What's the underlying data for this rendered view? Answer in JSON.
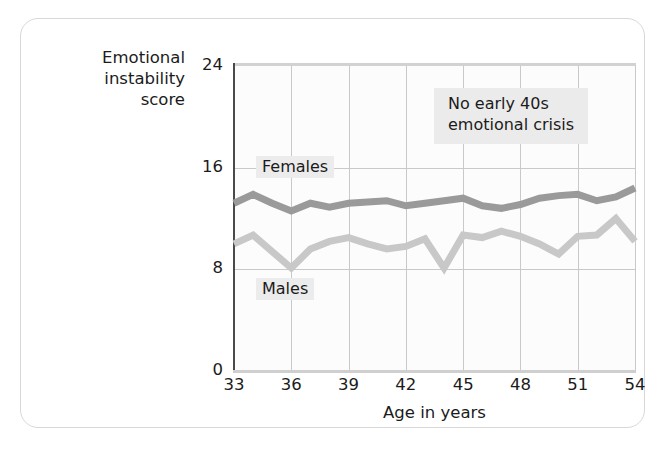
{
  "figure": {
    "y_axis_title": "Emotional\ninstability\nscore",
    "x_axis_title": "Age in years",
    "annotation": "No early 40s\nemotional crisis",
    "label_females": "Females",
    "label_males": "Males",
    "color_females": "#9a9a9a",
    "color_males": "#c8c8c8",
    "color_grid": "#c9c9c9",
    "color_axis": "#4a4a4a",
    "color_text": "#1b1b1b",
    "color_label_highlight": "#ececec",
    "color_card_border": "#d8d8d8"
  },
  "chart_data": {
    "type": "line",
    "title": "",
    "subtitle": "",
    "xlabel": "Age in years",
    "ylabel": "Emotional instability score",
    "xlim": [
      33,
      54
    ],
    "ylim": [
      0,
      24
    ],
    "ytick_labels": [
      "0",
      "8",
      "16",
      "24"
    ],
    "yticks": [
      0,
      8,
      16,
      24
    ],
    "xtick_labels": [
      "33",
      "36",
      "39",
      "42",
      "45",
      "48",
      "51",
      "54"
    ],
    "xticks": [
      33,
      36,
      39,
      42,
      45,
      48,
      51,
      54
    ],
    "grid": true,
    "legend_position": "inline-labels",
    "annotations": [
      {
        "text": "No early 40s emotional crisis",
        "x": 44.5,
        "y": 21.0
      }
    ],
    "x": [
      33,
      34,
      35,
      36,
      37,
      38,
      39,
      40,
      41,
      42,
      43,
      44,
      45,
      46,
      47,
      48,
      49,
      50,
      51,
      52,
      53,
      54
    ],
    "series": [
      {
        "name": "Females",
        "color": "#9a9a9a",
        "values": [
          13.2,
          13.9,
          13.2,
          12.6,
          13.2,
          12.9,
          13.2,
          13.3,
          13.4,
          13.0,
          13.2,
          13.4,
          13.6,
          13.0,
          12.8,
          13.1,
          13.6,
          13.8,
          13.9,
          13.4,
          13.7,
          14.4
        ]
      },
      {
        "name": "Males",
        "color": "#c8c8c8",
        "values": [
          10.0,
          10.7,
          9.4,
          8.1,
          9.6,
          10.2,
          10.5,
          10.0,
          9.6,
          9.8,
          10.4,
          8.1,
          10.7,
          10.5,
          11.0,
          10.6,
          10.0,
          9.2,
          10.6,
          10.7,
          12.0,
          10.2
        ]
      }
    ]
  }
}
